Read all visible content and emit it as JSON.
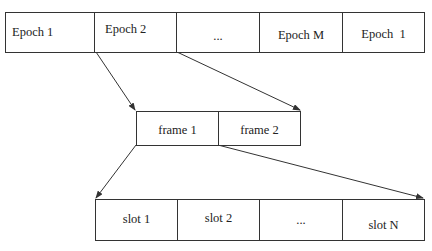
{
  "epochs": {
    "cells": [
      {
        "label": "Epoch 1"
      },
      {
        "label": "Epoch 2"
      },
      {
        "label": "..."
      },
      {
        "label": "Epoch M"
      },
      {
        "label": "Epoch  1"
      }
    ]
  },
  "frames": {
    "cells": [
      {
        "label": "frame 1"
      },
      {
        "label": "frame 2"
      }
    ]
  },
  "slots": {
    "cells": [
      {
        "label": "slot 1"
      },
      {
        "label": "slot 2"
      },
      {
        "label": "..."
      },
      {
        "label": "slot N"
      }
    ]
  },
  "colors": {
    "stroke": "#333333",
    "background": "#ffffff"
  }
}
